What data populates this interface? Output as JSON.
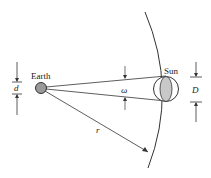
{
  "diagram": {
    "labels": {
      "earth": "Earth",
      "sun": "Sun",
      "d": "d",
      "D": "D",
      "omega": "ω",
      "r": "r"
    },
    "colors": {
      "line": "#333333",
      "earth_fill": "#9a9a9a",
      "sun_fill": "#c8c8c8"
    }
  }
}
